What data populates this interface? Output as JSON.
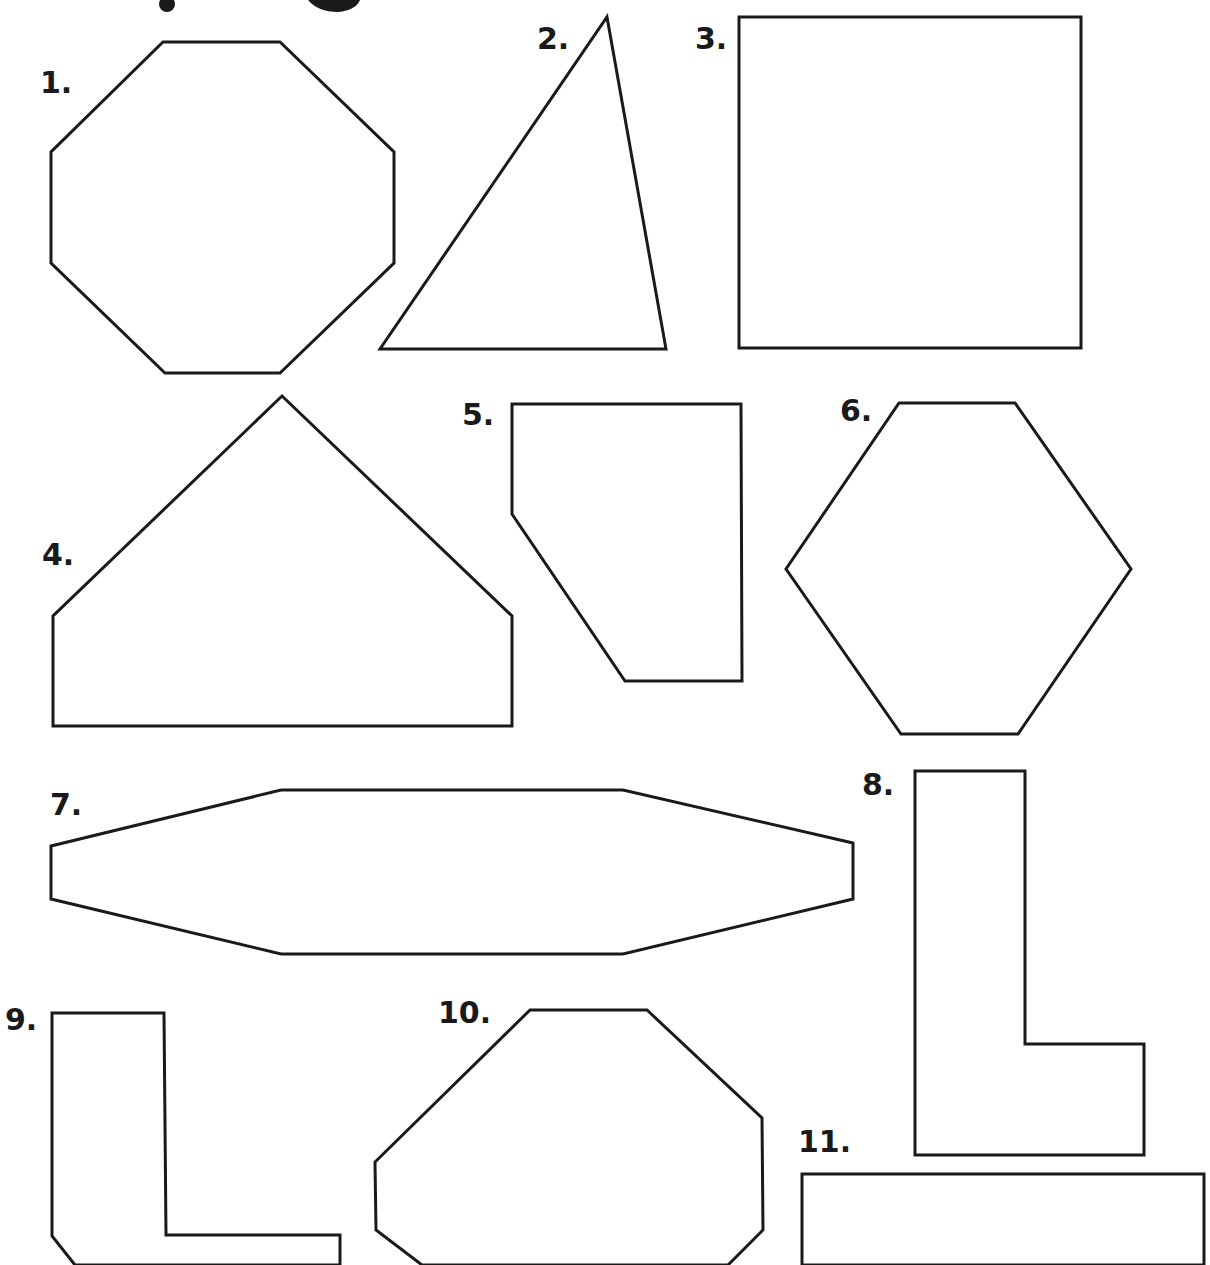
{
  "worksheet": {
    "colors": {
      "stroke": "#1a1a1a",
      "background": "#ffffff"
    },
    "shapes": [
      {
        "id": 1,
        "label": "1.",
        "kind": "octagon",
        "points": "163,42 280,42 394,152 394,263 280,373 165,373 51,263 51,152"
      },
      {
        "id": 2,
        "label": "2.",
        "kind": "triangle",
        "points": "607,17 666,349 380,349"
      },
      {
        "id": 3,
        "label": "3.",
        "kind": "square",
        "points": "739,17 1081,17 1081,348 739,348"
      },
      {
        "id": 4,
        "label": "4.",
        "kind": "pentagon",
        "points": "282,396 512,616 512,726 53,726 53,616"
      },
      {
        "id": 5,
        "label": "5.",
        "kind": "pentagon",
        "points": "512,404 741,404 742,681 625,681 512,514"
      },
      {
        "id": 6,
        "label": "6.",
        "kind": "hexagon",
        "points": "899,403 1015,403 1131,569 1018,734 901,734 786,569"
      },
      {
        "id": 7,
        "label": "7.",
        "kind": "hexagon",
        "points": "281,790 623,790 853,843 853,899 623,954 281,954 51,899 51,846"
      },
      {
        "id": 8,
        "label": "8.",
        "kind": "l-shape",
        "points": "915,771 1025,771 1025,1044 1144,1044 1144,1155 915,1155"
      },
      {
        "id": 9,
        "label": "9.",
        "kind": "l-shape",
        "points": "52,1013 164,1013 166,1235 340,1235 340,1265 75,1265 52,1236"
      },
      {
        "id": 10,
        "label": "10.",
        "kind": "octagon",
        "points": "530,1010 647,1010 762,1118 763,1230 728,1265 422,1265 376,1230 375,1162"
      },
      {
        "id": 11,
        "label": "11.",
        "kind": "rectangle",
        "points": "802,1174 1204,1174 1204,1265 802,1265"
      }
    ],
    "labels": [
      {
        "text": "1.",
        "x": 40,
        "y": 68
      },
      {
        "text": "2.",
        "x": 537,
        "y": 24
      },
      {
        "text": "3.",
        "x": 695,
        "y": 24
      },
      {
        "text": "4.",
        "x": 42,
        "y": 540
      },
      {
        "text": "5.",
        "x": 462,
        "y": 400
      },
      {
        "text": "6.",
        "x": 840,
        "y": 396
      },
      {
        "text": "7.",
        "x": 50,
        "y": 790
      },
      {
        "text": "8.",
        "x": 862,
        "y": 770
      },
      {
        "text": "9.",
        "x": 5,
        "y": 1005
      },
      {
        "text": "10.",
        "x": 438,
        "y": 998
      },
      {
        "text": "11.",
        "x": 798,
        "y": 1127
      }
    ]
  }
}
